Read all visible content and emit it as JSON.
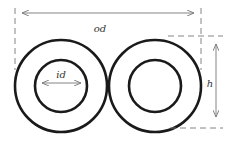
{
  "diagram": {
    "title": "",
    "labels": {
      "outer_diameter": "od",
      "inner_diameter": "id",
      "height": "h"
    },
    "shapes": {
      "left_ring": {
        "cx": 61,
        "cy": 86,
        "outer_r": 46,
        "inner_r": 26
      },
      "right_ring": {
        "cx": 155,
        "cy": 86,
        "outer_r": 46,
        "inner_r": 26
      }
    },
    "colors": {
      "ring_stroke": "#1a1a1a",
      "dimension_stroke": "#777777",
      "label_text": "#333333"
    }
  }
}
